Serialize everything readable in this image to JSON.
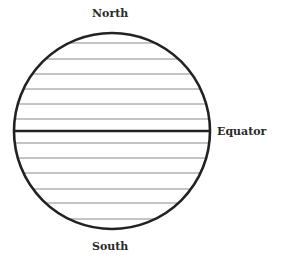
{
  "labels": {
    "north": "North",
    "south": "South",
    "equator": "Equator"
  },
  "globe": {
    "center_x": 112,
    "center_y": 131,
    "radius": 98,
    "parallels_y": [
      43,
      59,
      74,
      89,
      104,
      119,
      143,
      158,
      173,
      189,
      203,
      219
    ],
    "equator_y": 131,
    "outline_color": "#222222",
    "parallel_color": "#8a8a8a"
  }
}
